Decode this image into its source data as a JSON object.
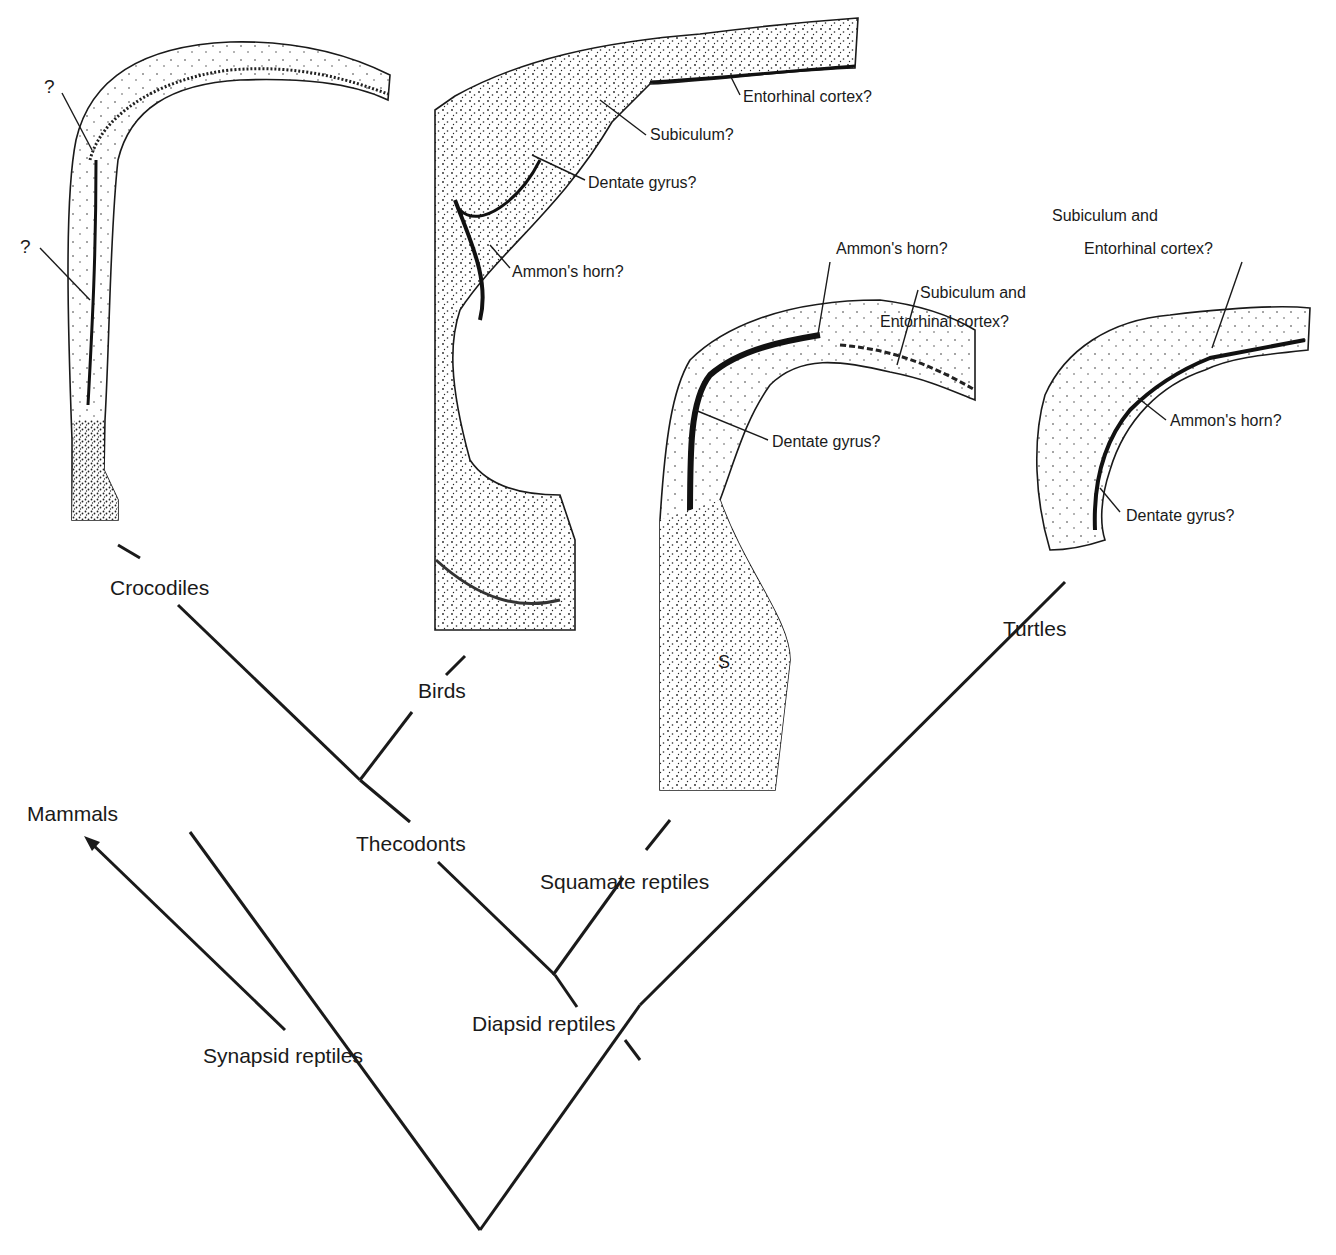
{
  "diagram": {
    "type": "cladogram-with-brain-sections",
    "taxa": {
      "crocodiles": "Crocodiles",
      "birds": "Birds",
      "turtles": "Turtles",
      "mammals": "Mammals",
      "thecodonts": "Thecodonts",
      "squamates": "Squamate reptiles",
      "diapsids": "Diapsid reptiles",
      "synapsids": "Synapsid reptiles"
    },
    "sections": {
      "crocodile": {
        "labels": [
          "?",
          "?"
        ]
      },
      "bird": {
        "labels": [
          "Entorhinal cortex?",
          "Subiculum?",
          "Dentate gyrus?",
          "Ammon's horn?"
        ]
      },
      "squamate": {
        "labels": [
          "Ammon's horn?",
          "Subiculum and",
          "Entorhinal cortex?",
          "Dentate gyrus?"
        ],
        "septum_mark": "S"
      },
      "turtle": {
        "labels": [
          "Subiculum and",
          "Entorhinal cortex?",
          "Ammon's horn?",
          "Dentate gyrus?"
        ]
      }
    }
  }
}
